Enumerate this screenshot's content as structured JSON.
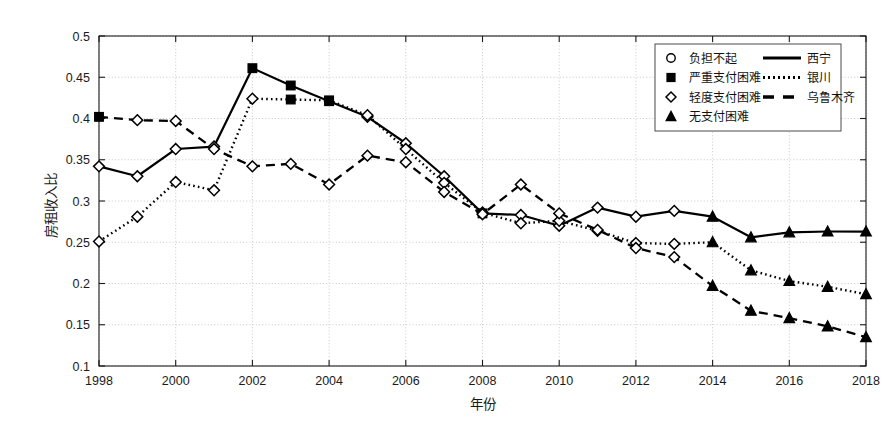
{
  "chart_data": {
    "type": "line",
    "title": "",
    "xlabel": "年份",
    "ylabel": "房租收入比",
    "xlim": [
      1998,
      2018
    ],
    "ylim": [
      0.1,
      0.5
    ],
    "xticks": [
      1998,
      2000,
      2002,
      2004,
      2006,
      2008,
      2010,
      2012,
      2014,
      2016,
      2018
    ],
    "xtick_labels": [
      "1998",
      "2000",
      "2002",
      "2004",
      "2006",
      "2008",
      "2010",
      "2012",
      "2014",
      "2016",
      "2018"
    ],
    "yticks": [
      0.1,
      0.15,
      0.2,
      0.25,
      0.3,
      0.35,
      0.4,
      0.45,
      0.5
    ],
    "ytick_labels": [
      "0.1",
      "0.15",
      "0.2",
      "0.25",
      "0.3",
      "0.35",
      "0.4",
      "0.45",
      "0.5"
    ],
    "grid": true,
    "grid_style": "dotted",
    "x": [
      1998,
      1999,
      2000,
      2001,
      2002,
      2003,
      2004,
      2005,
      2006,
      2007,
      2008,
      2009,
      2010,
      2011,
      2012,
      2013,
      2014,
      2015,
      2016,
      2017,
      2018
    ],
    "series": [
      {
        "name": "西宁",
        "line_style": "solid",
        "color": "#000000",
        "values": [
          0.342,
          0.33,
          0.363,
          0.366,
          0.461,
          0.44,
          0.421,
          0.402,
          0.37,
          0.33,
          0.285,
          0.283,
          0.27,
          0.292,
          0.281,
          0.288,
          0.281,
          0.256,
          0.262,
          0.263,
          0.263
        ],
        "markers": [
          "diamond",
          "diamond",
          "diamond",
          "diamond",
          "square",
          "square",
          "square",
          "diamond",
          "diamond",
          "diamond",
          "square",
          "diamond",
          "diamond",
          "diamond",
          "diamond",
          "diamond",
          "triangle",
          "triangle",
          "triangle",
          "triangle",
          "triangle"
        ]
      },
      {
        "name": "银川",
        "line_style": "dotted",
        "color": "#000000",
        "values": [
          0.251,
          0.281,
          0.323,
          0.313,
          0.424,
          0.423,
          0.422,
          0.404,
          0.363,
          0.322,
          0.286,
          0.273,
          0.276,
          0.264,
          0.249,
          0.248,
          0.25,
          0.216,
          0.203,
          0.196,
          0.187
        ],
        "markers": [
          "diamond",
          "diamond",
          "diamond",
          "diamond",
          "diamond",
          "square",
          "square",
          "diamond",
          "diamond",
          "diamond",
          "diamond",
          "diamond",
          "diamond",
          "diamond",
          "diamond",
          "diamond",
          "triangle",
          "triangle",
          "triangle",
          "triangle",
          "triangle"
        ]
      },
      {
        "name": "乌鲁木齐",
        "line_style": "dashed",
        "color": "#000000",
        "values": [
          0.402,
          0.398,
          0.397,
          0.363,
          0.342,
          0.345,
          0.32,
          0.355,
          0.347,
          0.311,
          0.284,
          0.32,
          0.285,
          0.265,
          0.243,
          0.232,
          0.197,
          0.167,
          0.158,
          0.148,
          0.135
        ],
        "markers": [
          "square",
          "diamond",
          "diamond",
          "diamond",
          "diamond",
          "diamond",
          "diamond",
          "diamond",
          "diamond",
          "diamond",
          "diamond",
          "diamond",
          "diamond",
          "diamond",
          "diamond",
          "diamond",
          "triangle",
          "triangle",
          "triangle",
          "triangle",
          "triangle"
        ]
      }
    ],
    "legend": {
      "position": "top-right",
      "marker_entries": [
        {
          "label": "负担不起",
          "marker": "circle"
        },
        {
          "label": "严重支付困难",
          "marker": "square"
        },
        {
          "label": "轻度支付困难",
          "marker": "diamond"
        },
        {
          "label": "无支付困难",
          "marker": "triangle"
        }
      ],
      "line_entries": [
        {
          "label": "西宁",
          "line_style": "solid"
        },
        {
          "label": "银川",
          "line_style": "dotted"
        },
        {
          "label": "乌鲁木齐",
          "line_style": "dashed"
        }
      ]
    }
  }
}
